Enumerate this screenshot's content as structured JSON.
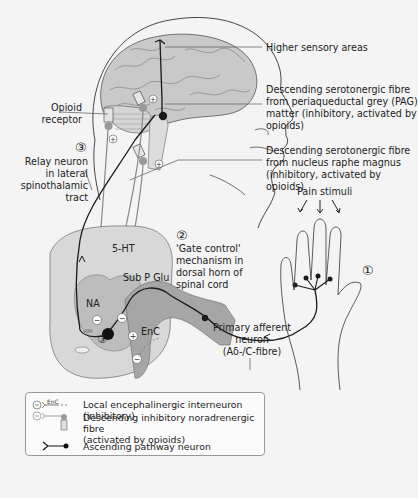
{
  "figure": {
    "colors": {
      "background": "#f4f4f4",
      "brain_fill": "#c9c9c9",
      "cord_light": "#d8d8d8",
      "cord_dark": "#a6a6a6",
      "neuron_line": "#1a1a1a",
      "fibre_line": "#888888"
    }
  },
  "labels": {
    "higher_sensory": "Higher sensory areas",
    "pag_fibre": "Descending serotonergic fibre\nfrom periaqueductal grey (PAG)\nmatter (inhibitory, activated by\nopioids)",
    "raphe_fibre": "Descending serotonergic fibre\nfrom nucleus raphe magnus\n(inhibitory, activated by opioids)",
    "opioid_receptor": "Opioid\nreceptor",
    "relay_neuron": "Relay neuron\nin lateral\nspinothalamic\ntract",
    "gate_control": "'Gate control'\nmechanism in\ndorsal horn of\nspinal cord",
    "pain_stimuli": "Pain stimuli",
    "primary_afferent": "Primary afferent\nneuron\n(Aδ-/C-fibre)",
    "five_ht": "5-HT",
    "sub_p_glu": "Sub P Glu",
    "na": "NA",
    "enc": "EnC"
  },
  "step_numbers": {
    "step1": "①",
    "step2": "②",
    "step3_relay": "③",
    "step3_cord": "③"
  },
  "signs": {
    "plus": "+",
    "minus": "−"
  },
  "legend": {
    "items": [
      {
        "icon": "encephalinergic-interneuron-icon",
        "icon_text": "EnC",
        "label": "Local encephalinergic interneuron (inhibitory)"
      },
      {
        "icon": "noradrenergic-fibre-icon",
        "label": "Descending inhibitory noradrenergic fibre\n(activated by opioids)"
      },
      {
        "icon": "ascending-neuron-icon",
        "label": "Ascending pathway neuron"
      }
    ]
  }
}
